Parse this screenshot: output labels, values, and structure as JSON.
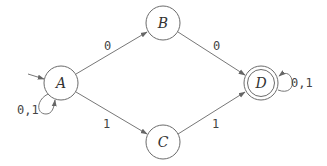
{
  "diagram": {
    "type": "finite-automaton",
    "states": [
      {
        "id": "A",
        "label": "A",
        "cx": 61,
        "cy": 83,
        "r": 17,
        "initial": true,
        "accepting": false
      },
      {
        "id": "B",
        "label": "B",
        "cx": 163,
        "cy": 23,
        "r": 17,
        "initial": false,
        "accepting": false
      },
      {
        "id": "C",
        "label": "C",
        "cx": 163,
        "cy": 142,
        "r": 17,
        "initial": false,
        "accepting": false
      },
      {
        "id": "D",
        "label": "D",
        "cx": 261,
        "cy": 83,
        "r": 17,
        "initial": false,
        "accepting": true
      }
    ],
    "transitions": [
      {
        "from": "A",
        "to": "A",
        "label": "0,1"
      },
      {
        "from": "A",
        "to": "B",
        "label": "0"
      },
      {
        "from": "A",
        "to": "C",
        "label": "1"
      },
      {
        "from": "B",
        "to": "D",
        "label": "0"
      },
      {
        "from": "C",
        "to": "D",
        "label": "1"
      },
      {
        "from": "D",
        "to": "D",
        "label": "0,1"
      }
    ],
    "labels": {
      "A": "A",
      "B": "B",
      "C": "C",
      "D": "D",
      "a_self": "0,1",
      "a_b": "0",
      "a_c": "1",
      "b_d": "0",
      "c_d": "1",
      "d_self": "0,1"
    }
  }
}
